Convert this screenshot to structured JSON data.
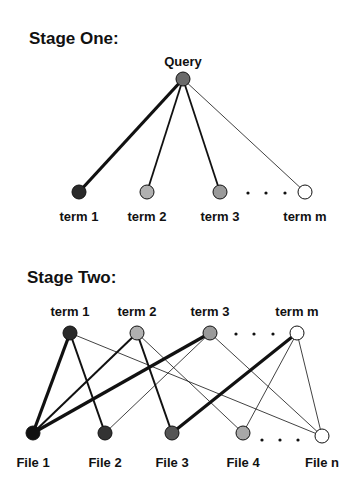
{
  "stage_one": {
    "title": "Stage One:",
    "root": {
      "label": "Query",
      "x": 183,
      "y": 79,
      "fill": "#6a6a6a"
    },
    "nodes": [
      {
        "label": "term 1",
        "x": 79,
        "y": 192,
        "fill": "#2a2a2a",
        "edge_width": 3.2
      },
      {
        "label": "term 2",
        "x": 147,
        "y": 192,
        "fill": "#b0b0b0",
        "edge_width": 1.8
      },
      {
        "label": "term 3",
        "x": 220,
        "y": 192,
        "fill": "#9a9a9a",
        "edge_width": 1.8
      },
      {
        "label": "term m",
        "x": 305,
        "y": 192,
        "fill": "#ffffff",
        "edge_width": 0.8
      }
    ],
    "ellipsis_dots": [
      248,
      266,
      285
    ]
  },
  "stage_two": {
    "title": "Stage Two:",
    "terms": [
      {
        "label": "term 1",
        "x": 70,
        "y": 333,
        "fill": "#2a2a2a"
      },
      {
        "label": "term 2",
        "x": 137,
        "y": 333,
        "fill": "#b0b0b0"
      },
      {
        "label": "term 3",
        "x": 210,
        "y": 333,
        "fill": "#9a9a9a"
      },
      {
        "label": "term m",
        "x": 297,
        "y": 333,
        "fill": "#ffffff"
      }
    ],
    "term_dots": [
      236,
      254,
      273
    ],
    "files": [
      {
        "label": "File 1",
        "x": 33,
        "y": 433,
        "fill": "#111111"
      },
      {
        "label": "File 2",
        "x": 105,
        "y": 433,
        "fill": "#333333"
      },
      {
        "label": "File 3",
        "x": 172,
        "y": 433,
        "fill": "#555555"
      },
      {
        "label": "File 4",
        "x": 243,
        "y": 433,
        "fill": "#a8a8a8"
      },
      {
        "label": "File n",
        "x": 322,
        "y": 436,
        "fill": "#ffffff"
      }
    ],
    "file_dots": [
      262,
      280,
      298
    ],
    "edges": [
      {
        "from": 0,
        "to": 0,
        "w": 3.2
      },
      {
        "from": 0,
        "to": 1,
        "w": 2.0
      },
      {
        "from": 0,
        "to": 4,
        "w": 0.8
      },
      {
        "from": 1,
        "to": 0,
        "w": 2.0
      },
      {
        "from": 1,
        "to": 2,
        "w": 2.0
      },
      {
        "from": 1,
        "to": 3,
        "w": 0.8
      },
      {
        "from": 2,
        "to": 0,
        "w": 3.2
      },
      {
        "from": 2,
        "to": 1,
        "w": 0.8
      },
      {
        "from": 2,
        "to": 4,
        "w": 0.8
      },
      {
        "from": 3,
        "to": 2,
        "w": 3.2
      },
      {
        "from": 3,
        "to": 3,
        "w": 0.8
      },
      {
        "from": 3,
        "to": 4,
        "w": 0.8
      }
    ]
  }
}
